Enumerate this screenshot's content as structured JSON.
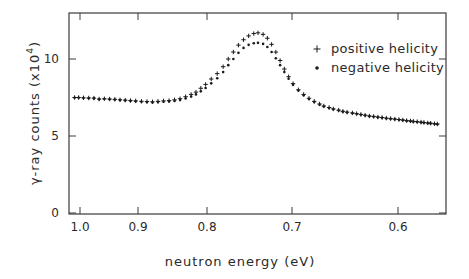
{
  "chart_data": {
    "type": "scatter",
    "title": "",
    "xlabel": "neutron energy (eV)",
    "ylabel": "γ-ray counts (x10⁴)",
    "y_label_main": "γ-ray counts (x10",
    "y_label_exp": "4",
    "y_label_close": ")",
    "xlim": [
      1.02,
      0.55
    ],
    "ylim": [
      0,
      13
    ],
    "x_reversed": true,
    "grid": false,
    "legend_position": "top-right",
    "x_ticks": [
      {
        "value": 1.0,
        "label": "1.0"
      },
      {
        "value": 0.9,
        "label": "0.9"
      },
      {
        "value": 0.8,
        "label": "0.8"
      },
      {
        "value": 0.7,
        "label": "0.7"
      },
      {
        "value": 0.6,
        "label": "0.6"
      }
    ],
    "y_ticks": [
      {
        "value": 0,
        "label": "0"
      },
      {
        "value": 5,
        "label": "5"
      },
      {
        "value": 10,
        "label": "10"
      }
    ],
    "legend": [
      {
        "symbol": "+",
        "label": "positive helicity"
      },
      {
        "symbol": "•",
        "label": "negative helicity"
      }
    ],
    "resonance_peak_eV": 0.734,
    "series": [
      {
        "name": "positive helicity",
        "marker": "plus",
        "x": [
          1.012,
          1.003,
          0.994,
          0.985,
          0.976,
          0.967,
          0.958,
          0.949,
          0.94,
          0.931,
          0.922,
          0.913,
          0.904,
          0.895,
          0.887,
          0.879,
          0.871,
          0.863,
          0.855,
          0.847,
          0.839,
          0.831,
          0.823,
          0.816,
          0.809,
          0.802,
          0.795,
          0.788,
          0.781,
          0.775,
          0.769,
          0.763,
          0.757,
          0.751,
          0.745,
          0.74,
          0.734,
          0.729,
          0.724,
          0.719,
          0.714,
          0.709,
          0.704,
          0.699,
          0.694,
          0.689,
          0.684,
          0.679,
          0.674,
          0.67,
          0.665,
          0.661,
          0.656,
          0.652,
          0.648,
          0.643,
          0.639,
          0.635,
          0.631,
          0.627,
          0.623,
          0.619,
          0.615,
          0.611,
          0.607,
          0.603,
          0.599,
          0.595,
          0.591,
          0.587,
          0.584,
          0.58,
          0.576,
          0.573,
          0.569,
          0.566,
          0.562,
          0.559
        ],
        "y": [
          7.5,
          7.5,
          7.48,
          7.47,
          7.46,
          7.4,
          7.42,
          7.4,
          7.38,
          7.35,
          7.33,
          7.3,
          7.28,
          7.25,
          7.24,
          7.22,
          7.25,
          7.28,
          7.3,
          7.35,
          7.42,
          7.55,
          7.7,
          7.85,
          8.1,
          8.35,
          8.7,
          9.05,
          9.5,
          10.0,
          10.45,
          10.9,
          11.25,
          11.5,
          11.65,
          11.7,
          11.6,
          11.35,
          10.95,
          10.45,
          9.9,
          9.35,
          8.85,
          8.4,
          8.0,
          7.7,
          7.45,
          7.25,
          7.08,
          6.95,
          6.85,
          6.76,
          6.68,
          6.6,
          6.55,
          6.5,
          6.45,
          6.4,
          6.35,
          6.3,
          6.27,
          6.23,
          6.2,
          6.16,
          6.13,
          6.1,
          6.07,
          6.04,
          6.0,
          5.98,
          5.95,
          5.93,
          5.9,
          5.88,
          5.85,
          5.83,
          5.8,
          5.78
        ]
      },
      {
        "name": "negative helicity",
        "marker": "dot",
        "x": [
          1.012,
          1.003,
          0.994,
          0.985,
          0.976,
          0.967,
          0.958,
          0.949,
          0.94,
          0.931,
          0.922,
          0.913,
          0.904,
          0.895,
          0.887,
          0.879,
          0.871,
          0.863,
          0.855,
          0.847,
          0.839,
          0.831,
          0.823,
          0.816,
          0.809,
          0.802,
          0.795,
          0.788,
          0.781,
          0.775,
          0.769,
          0.763,
          0.757,
          0.751,
          0.745,
          0.74,
          0.734,
          0.729,
          0.724,
          0.719,
          0.714,
          0.709,
          0.704,
          0.699,
          0.694,
          0.689,
          0.684,
          0.679,
          0.674,
          0.67,
          0.665,
          0.661,
          0.656,
          0.652,
          0.648,
          0.643,
          0.639,
          0.635,
          0.631,
          0.627,
          0.623,
          0.619,
          0.615,
          0.611,
          0.607,
          0.603,
          0.599,
          0.595,
          0.591,
          0.587,
          0.584,
          0.58,
          0.576,
          0.573,
          0.569,
          0.566,
          0.562,
          0.559
        ],
        "y": [
          7.48,
          7.48,
          7.46,
          7.45,
          7.44,
          7.38,
          7.4,
          7.38,
          7.36,
          7.33,
          7.3,
          7.28,
          7.25,
          7.22,
          7.2,
          7.18,
          7.2,
          7.22,
          7.24,
          7.28,
          7.33,
          7.44,
          7.56,
          7.7,
          7.9,
          8.12,
          8.42,
          8.75,
          9.15,
          9.6,
          10.0,
          10.4,
          10.72,
          10.92,
          11.02,
          11.05,
          10.98,
          10.78,
          10.45,
          10.05,
          9.6,
          9.15,
          8.72,
          8.32,
          7.95,
          7.65,
          7.4,
          7.2,
          7.03,
          6.92,
          6.82,
          6.74,
          6.66,
          6.58,
          6.53,
          6.48,
          6.43,
          6.38,
          6.33,
          6.28,
          6.25,
          6.21,
          6.18,
          6.14,
          6.11,
          6.08,
          6.05,
          6.02,
          5.98,
          5.96,
          5.93,
          5.91,
          5.88,
          5.86,
          5.83,
          5.81,
          5.78,
          5.76
        ]
      }
    ]
  }
}
